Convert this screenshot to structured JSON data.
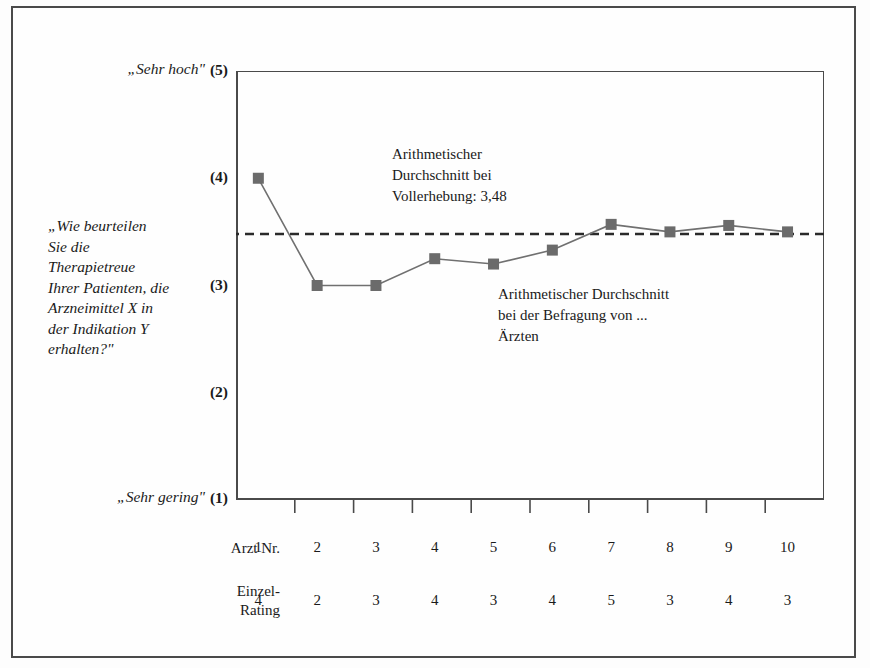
{
  "axis": {
    "top_label": "„Sehr hoch\"",
    "bottom_label": "„Sehr gering\"",
    "ticks": [
      "(5)",
      "(4)",
      "(3)",
      "(2)",
      "(1)"
    ]
  },
  "question": {
    "lines": [
      "„Wie beurteilen",
      "Sie die",
      "Therapietreue",
      "Ihrer Patienten, die",
      "Arzneimittel X in",
      "der Indikation Y",
      "erhalten?\""
    ]
  },
  "annotations": {
    "full_survey": {
      "lines": [
        "Arithmetischer",
        "Durchschnitt bei",
        "Vollerhebung: 3,48"
      ]
    },
    "running_mean": {
      "lines": [
        "Arithmetischer Durchschnitt",
        "bei der Befragung von ...",
        "Ärzten"
      ]
    }
  },
  "table": {
    "row_labels": [
      "Arzt Nr.",
      "Einzel-\nRating"
    ],
    "row_label_arzt": "Arzt Nr.",
    "row_label_rating_line1": "Einzel-",
    "row_label_rating_line2": "Rating",
    "arzt_nr": [
      "1",
      "2",
      "3",
      "4",
      "5",
      "6",
      "7",
      "8",
      "9",
      "10"
    ],
    "einzel_rating": [
      "4",
      "2",
      "3",
      "4",
      "3",
      "4",
      "5",
      "3",
      "4",
      "3"
    ]
  },
  "colors": {
    "marker": "#6b6b6b",
    "line": "#707070",
    "axis": "#4a4a4a",
    "reference": "#2a2a2a"
  },
  "chart_data": {
    "type": "line",
    "title": "",
    "xlabel": "Arzt Nr.",
    "ylabel": "",
    "categories": [
      "1",
      "2",
      "3",
      "4",
      "5",
      "6",
      "7",
      "8",
      "9",
      "10"
    ],
    "ylim": [
      1,
      5
    ],
    "yticks": [
      1,
      2,
      3,
      4,
      5
    ],
    "ytick_labels": [
      "(1)",
      "(2)",
      "(3)",
      "(4)",
      "(5)"
    ],
    "ytick_endpoint_labels": {
      "5": "„Sehr hoch\"",
      "1": "„Sehr gering\""
    },
    "grid": false,
    "legend": "none",
    "series": [
      {
        "name": "Arithmetischer Durchschnitt bei der Befragung von ... Ärzten",
        "marker": "square",
        "values": [
          4.0,
          3.0,
          3.0,
          3.25,
          3.2,
          3.33,
          3.57,
          3.5,
          3.56,
          3.5
        ]
      },
      {
        "name": "Einzel-Rating",
        "values": [
          4,
          2,
          3,
          4,
          3,
          4,
          5,
          3,
          4,
          3
        ]
      }
    ],
    "reference_line": {
      "label": "Arithmetischer Durchschnitt bei Vollerhebung: 3,48",
      "value": 3.48,
      "style": "dashed",
      "orientation": "horizontal"
    }
  }
}
